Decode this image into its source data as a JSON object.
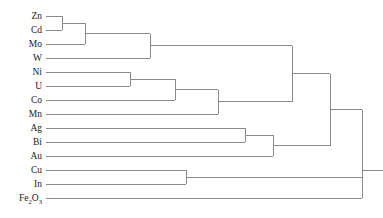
{
  "figure": {
    "title": "",
    "type": "dendrogram",
    "background_color": "#ffffff",
    "line_color": "#8a8a8a",
    "text_color": "#1a1a1a"
  },
  "chart_data": {
    "type": "dendrogram",
    "title": "",
    "xlabel": "",
    "ylabel": "",
    "orientation": "horizontal-left-to-right",
    "grid": false,
    "legend": "none",
    "axis_shown": false,
    "leaf_labels": [
      "Zn",
      "Cd",
      "Mo",
      "W",
      "Ni",
      "U",
      "Co",
      "Mn",
      "Ag",
      "Bi",
      "Au",
      "Cu",
      "In",
      "Fe2O3"
    ],
    "leaf_labels_display": [
      {
        "text": "Zn",
        "sub": null
      },
      {
        "text": "Cd",
        "sub": null
      },
      {
        "text": "Mo",
        "sub": null
      },
      {
        "text": "W",
        "sub": null
      },
      {
        "text": "Ni",
        "sub": null
      },
      {
        "text": "U",
        "sub": null
      },
      {
        "text": "Co",
        "sub": null
      },
      {
        "text": "Mn",
        "sub": null
      },
      {
        "text": "Ag",
        "sub": null
      },
      {
        "text": "Bi",
        "sub": null
      },
      {
        "text": "Au",
        "sub": null
      },
      {
        "text": "Cu",
        "sub": null
      },
      {
        "text": "In",
        "sub": null
      },
      {
        "text": "Fe2O3",
        "sub": "formula"
      }
    ],
    "leaf_y": [
      16,
      30,
      44,
      58,
      72,
      86,
      100,
      114,
      128,
      142,
      156,
      170,
      184,
      198
    ],
    "leaf_start_x": 46,
    "merges": [
      {
        "id": "m1",
        "label": "Zn+Cd",
        "children": [
          "Zn",
          "Cd"
        ],
        "x": 62,
        "y": 23
      },
      {
        "id": "m2",
        "label": "(Zn,Cd)+Mo",
        "children": [
          "m1",
          "Mo"
        ],
        "x": 85,
        "y": 33.5
      },
      {
        "id": "m3",
        "label": "(Zn,Cd,Mo)+W",
        "children": [
          "m2",
          "W"
        ],
        "x": 150,
        "y": 45.75
      },
      {
        "id": "m4",
        "label": "Ni+U",
        "children": [
          "Ni",
          "U"
        ],
        "x": 130,
        "y": 79
      },
      {
        "id": "m5",
        "label": "(Ni,U)+Co",
        "children": [
          "m4",
          "Co"
        ],
        "x": 175,
        "y": 89.5
      },
      {
        "id": "m6",
        "label": "(Ni,U,Co)+Mn",
        "children": [
          "m5",
          "Mn"
        ],
        "x": 218,
        "y": 101.75
      },
      {
        "id": "m7",
        "label": "topA+topB",
        "children": [
          "m3",
          "m6"
        ],
        "x": 292,
        "y": 73.75
      },
      {
        "id": "m8",
        "label": "Ag+Bi",
        "children": [
          "Ag",
          "Bi"
        ],
        "x": 245,
        "y": 135
      },
      {
        "id": "m9",
        "label": "(Ag,Bi)+Au",
        "children": [
          "m8",
          "Au"
        ],
        "x": 273,
        "y": 145.5
      },
      {
        "id": "m10",
        "label": "upper+metals",
        "children": [
          "m7",
          "m9"
        ],
        "x": 330,
        "y": 109.6
      },
      {
        "id": "m11",
        "label": "Cu+In",
        "children": [
          "Cu",
          "In"
        ],
        "x": 186,
        "y": 177
      },
      {
        "id": "m12",
        "label": "main+CuIn",
        "children": [
          "m10",
          "m11"
        ],
        "x": 362,
        "y": 143.3
      },
      {
        "id": "m13",
        "label": "root",
        "children": [
          "m12",
          "Fe2O3"
        ],
        "x": 362,
        "y": 170.6
      }
    ],
    "root_x": 362,
    "n_leaves": 14,
    "x_range": [
      46,
      383
    ]
  }
}
